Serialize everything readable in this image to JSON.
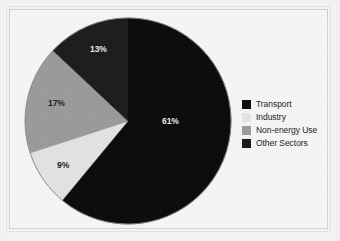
{
  "chart_data": {
    "type": "pie",
    "title": "",
    "subtitle": "",
    "xlabel": "",
    "ylabel": "",
    "grid": false,
    "legend_position": "right",
    "start_angle_deg": 0,
    "direction": "clockwise",
    "categories": [
      "Transport",
      "Industry",
      "Non-energy Use",
      "Other Sectors"
    ],
    "values": [
      61,
      9,
      17,
      13
    ],
    "value_unit": "%",
    "data_labels": [
      "61%",
      "9%",
      "17%",
      "13%"
    ],
    "slice_colors": [
      "#0b0b0b",
      "#e2e2e2",
      "#9a9a9a",
      "#1c1c1c"
    ],
    "slices": [
      {
        "label": "Transport",
        "value": 61,
        "data_label": "61%",
        "color": "#0b0b0b",
        "label_color": "light"
      },
      {
        "label": "Industry",
        "value": 9,
        "data_label": "9%",
        "color": "#e2e2e2",
        "label_color": "dark"
      },
      {
        "label": "Non-energy Use",
        "value": 17,
        "data_label": "17%",
        "color": "#9a9a9a",
        "label_color": "dark"
      },
      {
        "label": "Other Sectors",
        "value": 13,
        "data_label": "13%",
        "color": "#1c1c1c",
        "label_color": "light"
      }
    ]
  },
  "legend": {
    "items": [
      {
        "label": "Transport",
        "color": "#0d0d0d"
      },
      {
        "label": "Industry",
        "color": "#e4e4e4"
      },
      {
        "label": "Non-energy Use",
        "color": "#9b9b9b"
      },
      {
        "label": "Other Sectors",
        "color": "#1a1a1a"
      }
    ]
  },
  "figure": {
    "background_color": "#f3f3f3",
    "frame_color": "#d2d2d2",
    "pie_outline_color": "#8a8a8a"
  }
}
